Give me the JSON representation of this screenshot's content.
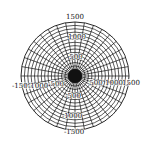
{
  "diagram": {
    "type": "polar-grid",
    "center": [
      75,
      76
    ],
    "outer_radius": 54,
    "ring_count": 16,
    "spoke_count": 36,
    "line_color": "#111111",
    "background": "#ffffff"
  },
  "labels": {
    "top": "1500",
    "top_inner": "1000",
    "top_mid": "500",
    "bottom": "-1500",
    "bottom_inner": "-1000",
    "bottom_mid": "-500",
    "left": "-1500",
    "left_inner": "-1000",
    "left_mid": "-500",
    "right": "1500",
    "right_inner": "1000",
    "right_mid": "500"
  }
}
